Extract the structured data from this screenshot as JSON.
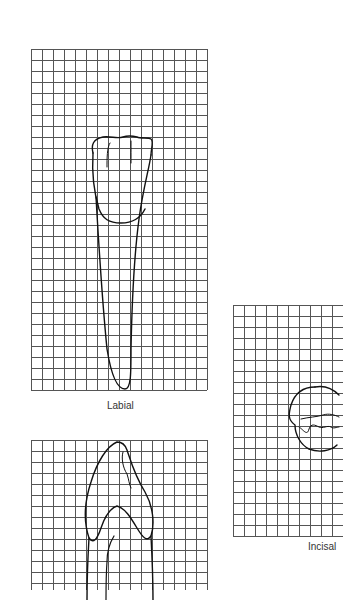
{
  "figure": {
    "panels": [
      {
        "id": "labial",
        "label": "Labial",
        "x": 31,
        "y": 49,
        "cols": 16,
        "rows": 31,
        "cell": 11
      },
      {
        "id": "proximal",
        "label": "",
        "x": 31,
        "y": 440,
        "cols": 16,
        "rows": 14,
        "cell": 11
      },
      {
        "id": "incisal",
        "label": "Incisal",
        "x": 233,
        "y": 305,
        "cols": 10,
        "rows": 21,
        "cell": 11
      }
    ],
    "labels": {
      "labial": "Labial",
      "incisal": "Incisal"
    },
    "colors": {
      "grid": "#555555",
      "outline": "#111111",
      "text": "#333333"
    }
  }
}
